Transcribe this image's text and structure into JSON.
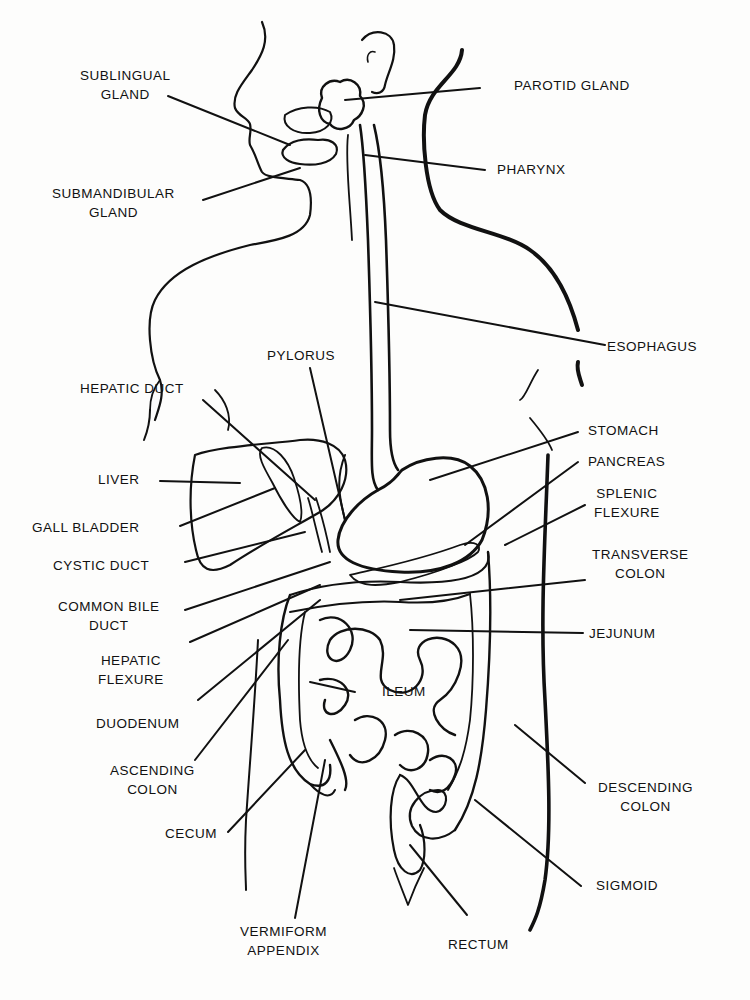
{
  "diagram": {
    "labels": {
      "sublingual_gland": [
        "SUBLINGUAL",
        "GLAND"
      ],
      "submandibular_gland": [
        "SUBMANDIBULAR",
        "GLAND"
      ],
      "parotid_gland": [
        "PAROTID GLAND"
      ],
      "pharynx": [
        "PHARYNX"
      ],
      "esophagus": [
        "ESOPHAGUS"
      ],
      "pylorus": [
        "PYLORUS"
      ],
      "hepatic_duct": [
        "HEPATIC DUCT"
      ],
      "liver": [
        "LIVER"
      ],
      "gall_bladder": [
        "GALL BLADDER"
      ],
      "cystic_duct": [
        "CYSTIC DUCT"
      ],
      "common_bile_duct": [
        "COMMON BILE",
        "DUCT"
      ],
      "hepatic_flexure": [
        "HEPATIC",
        "FLEXURE"
      ],
      "duodenum": [
        "DUODENUM"
      ],
      "ascending_colon": [
        "ASCENDING",
        "COLON"
      ],
      "cecum": [
        "CECUM"
      ],
      "vermiform_appendix": [
        "VERMIFORM",
        "APPENDIX"
      ],
      "stomach": [
        "STOMACH"
      ],
      "pancreas": [
        "PANCREAS"
      ],
      "splenic_flexure": [
        "SPLENIC",
        "FLEXURE"
      ],
      "transverse_colon": [
        "TRANSVERSE",
        "COLON"
      ],
      "jejunum": [
        "JEJUNUM"
      ],
      "ileum": [
        "ILEUM"
      ],
      "descending_colon": [
        "DESCENDING",
        "COLON"
      ],
      "sigmoid": [
        "SIGMOID"
      ],
      "rectum": [
        "RECTUM"
      ]
    }
  }
}
